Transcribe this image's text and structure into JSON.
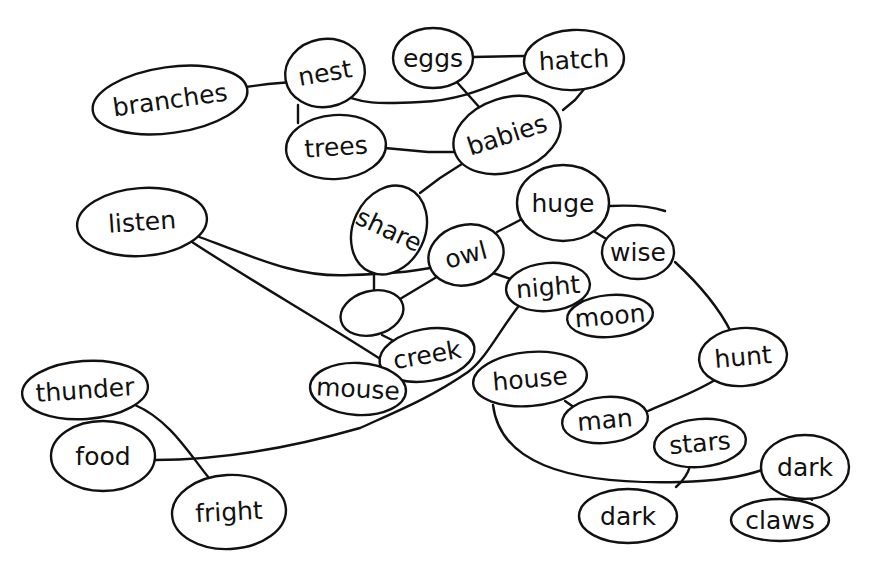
{
  "diagram": {
    "type": "concept-map",
    "style": "hand-drawn",
    "colors": {
      "ink": "#111111",
      "background": "#ffffff"
    },
    "nodes": [
      {
        "id": "branches",
        "label": "branches",
        "cx": 170,
        "cy": 100,
        "rx": 78,
        "ry": 33,
        "rot": -8
      },
      {
        "id": "nest",
        "label": "nest",
        "cx": 325,
        "cy": 73,
        "rx": 40,
        "ry": 34,
        "rot": -10
      },
      {
        "id": "eggs",
        "label": "eggs",
        "cx": 433,
        "cy": 58,
        "rx": 40,
        "ry": 30,
        "rot": 0
      },
      {
        "id": "hatch",
        "label": "hatch",
        "cx": 574,
        "cy": 60,
        "rx": 50,
        "ry": 30,
        "rot": -3
      },
      {
        "id": "trees",
        "label": "trees",
        "cx": 336,
        "cy": 147,
        "rx": 50,
        "ry": 32,
        "rot": -4
      },
      {
        "id": "babies",
        "label": "babies",
        "cx": 507,
        "cy": 135,
        "rx": 55,
        "ry": 37,
        "rot": -18
      },
      {
        "id": "listen",
        "label": "listen",
        "cx": 142,
        "cy": 222,
        "rx": 65,
        "ry": 34,
        "rot": -4
      },
      {
        "id": "share",
        "label": "share",
        "cx": 389,
        "cy": 230,
        "rx": 36,
        "ry": 46,
        "rot": 25
      },
      {
        "id": "huge",
        "label": "huge",
        "cx": 563,
        "cy": 203,
        "rx": 46,
        "ry": 38,
        "rot": 0
      },
      {
        "id": "owl",
        "label": "owl",
        "cx": 466,
        "cy": 255,
        "rx": 38,
        "ry": 30,
        "rot": -15
      },
      {
        "id": "wise",
        "label": "wise",
        "cx": 638,
        "cy": 252,
        "rx": 36,
        "ry": 27,
        "rot": 0
      },
      {
        "id": "blank",
        "label": "",
        "cx": 372,
        "cy": 313,
        "rx": 32,
        "ry": 22,
        "rot": -15
      },
      {
        "id": "night",
        "label": "night",
        "cx": 548,
        "cy": 287,
        "rx": 42,
        "ry": 24,
        "rot": -5
      },
      {
        "id": "moon",
        "label": "moon",
        "cx": 610,
        "cy": 316,
        "rx": 43,
        "ry": 21,
        "rot": -5
      },
      {
        "id": "creek",
        "label": "creek",
        "cx": 427,
        "cy": 355,
        "rx": 48,
        "ry": 26,
        "rot": -10
      },
      {
        "id": "hunt",
        "label": "hunt",
        "cx": 743,
        "cy": 357,
        "rx": 44,
        "ry": 29,
        "rot": -5
      },
      {
        "id": "mouse",
        "label": "mouse",
        "cx": 358,
        "cy": 389,
        "rx": 48,
        "ry": 26,
        "rot": 3
      },
      {
        "id": "house",
        "label": "house",
        "cx": 530,
        "cy": 379,
        "rx": 57,
        "ry": 27,
        "rot": -5
      },
      {
        "id": "thunder",
        "label": "thunder",
        "cx": 85,
        "cy": 390,
        "rx": 63,
        "ry": 29,
        "rot": -4
      },
      {
        "id": "man",
        "label": "man",
        "cx": 605,
        "cy": 420,
        "rx": 43,
        "ry": 23,
        "rot": -5
      },
      {
        "id": "stars",
        "label": "stars",
        "cx": 700,
        "cy": 443,
        "rx": 46,
        "ry": 24,
        "rot": -5
      },
      {
        "id": "food",
        "label": "food",
        "cx": 103,
        "cy": 456,
        "rx": 52,
        "ry": 35,
        "rot": 0
      },
      {
        "id": "dark-right",
        "label": "dark",
        "cx": 805,
        "cy": 467,
        "rx": 44,
        "ry": 32,
        "rot": 0
      },
      {
        "id": "fright",
        "label": "fright",
        "cx": 229,
        "cy": 512,
        "rx": 57,
        "ry": 37,
        "rot": -3
      },
      {
        "id": "dark-bottom",
        "label": "dark",
        "cx": 628,
        "cy": 516,
        "rx": 49,
        "ry": 27,
        "rot": 0
      },
      {
        "id": "claws",
        "label": "claws",
        "cx": 780,
        "cy": 520,
        "rx": 49,
        "ry": 21,
        "rot": 0
      }
    ],
    "edges": [
      {
        "from": "branches",
        "to": "nest",
        "d": "M 238 88 L 268 84 L 292 82"
      },
      {
        "from": "nest",
        "to": "trees",
        "d": "M 298 105 L 298 123"
      },
      {
        "from": "nest",
        "to": "hatch",
        "d": "M 332 90 C 360 105 380 104 420 102 C 470 100 500 80 528 72"
      },
      {
        "from": "eggs",
        "to": "hatch",
        "d": "M 473 57 L 524 56"
      },
      {
        "from": "eggs",
        "to": "babies",
        "d": "M 455 80 L 480 108"
      },
      {
        "from": "hatch",
        "to": "babies",
        "d": "M 585 88 L 575 100 L 563 110"
      },
      {
        "from": "trees",
        "to": "babies",
        "d": "M 385 148 L 428 152 L 455 152"
      },
      {
        "from": "babies",
        "to": "share",
        "d": "M 465 162 L 440 178 L 420 193"
      },
      {
        "from": "listen",
        "to": "owl",
        "d": "M 197 236 C 260 260 300 278 350 275 C 390 274 410 272 430 268"
      },
      {
        "from": "listen",
        "to": "creek",
        "d": "M 192 242 C 250 280 320 320 385 362"
      },
      {
        "from": "share",
        "to": "blank",
        "d": "M 374 274 L 374 290"
      },
      {
        "from": "owl",
        "to": "blank",
        "d": "M 440 275 L 395 302"
      },
      {
        "from": "owl",
        "to": "huge",
        "d": "M 497 232 L 524 218"
      },
      {
        "from": "owl",
        "to": "night",
        "d": "M 493 273 L 517 281"
      },
      {
        "from": "huge",
        "to": "edge-tail",
        "d": "M 610 206 C 630 205 650 206 665 211"
      },
      {
        "from": "huge",
        "to": "wise",
        "d": "M 595 232 L 608 240"
      },
      {
        "from": "night",
        "to": "moon",
        "d": "M 580 296 L 586 306"
      },
      {
        "from": "night",
        "to": "food",
        "d": "M 518 307 C 500 330 485 360 468 372 C 430 398 400 410 360 428 C 290 448 220 460 155 460"
      },
      {
        "from": "blank",
        "to": "creek",
        "d": "M 382 335 L 392 340"
      },
      {
        "from": "creek",
        "to": "mouse",
        "d": "M 386 368 L 392 382"
      },
      {
        "from": "wise",
        "to": "hunt",
        "d": "M 675 262 C 700 285 720 310 731 332"
      },
      {
        "from": "hunt",
        "to": "man",
        "d": "M 715 380 C 690 395 665 403 648 411"
      },
      {
        "from": "house",
        "to": "man",
        "d": "M 565 401 L 578 410"
      },
      {
        "from": "house",
        "to": "dark-right",
        "d": "M 493 405 C 500 460 560 485 680 482 C 720 481 745 476 762 470"
      },
      {
        "from": "stars",
        "to": "dark-bottom",
        "d": "M 690 466 C 688 474 684 480 676 487"
      },
      {
        "from": "thunder",
        "to": "fright",
        "d": "M 135 405 C 170 420 190 455 209 478"
      },
      {
        "from": "dark-right",
        "to": "claws",
        "d": "M 810 498 L 812 500"
      }
    ]
  }
}
